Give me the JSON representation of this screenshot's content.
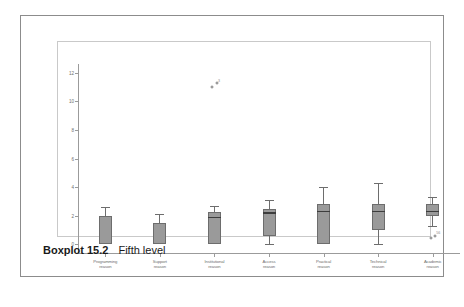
{
  "caption": {
    "title": "Boxplot 15.2",
    "text": "Fifth level"
  },
  "chart_data": {
    "type": "boxplot",
    "title": "",
    "xlabel": "",
    "ylabel": "",
    "ylim": [
      -0.6,
      12.6
    ],
    "yticks": [
      0,
      2,
      4,
      6,
      8,
      10,
      12
    ],
    "ytick_labels": [
      "0",
      "2",
      "4",
      "6",
      "8",
      "10",
      "12"
    ],
    "grid": false,
    "legend": "none",
    "categories": [
      "Programming\nreason",
      "Support\nreason",
      "Institutional\nreason",
      "Access\nreason",
      "Practical\nreason",
      "Technical\nreason",
      "Academic\nreason"
    ],
    "boxes": [
      {
        "label": "Programming reason",
        "whisker_low": 0.0,
        "q1": 0.0,
        "median": 0.0,
        "q3": 2.0,
        "whisker_high": 2.6,
        "outliers": []
      },
      {
        "label": "Support reason",
        "whisker_low": 0.0,
        "q1": 0.0,
        "median": 0.0,
        "q3": 1.5,
        "whisker_high": 2.1,
        "outliers": []
      },
      {
        "label": "Institutional reason",
        "whisker_low": 0.0,
        "q1": 0.0,
        "median": 1.9,
        "q3": 2.25,
        "whisker_high": 2.7,
        "outliers": [
          11.0,
          11.25
        ]
      },
      {
        "label": "Access reason",
        "whisker_low": 0.0,
        "q1": 0.6,
        "median": 2.2,
        "q3": 2.5,
        "whisker_high": 3.1,
        "outliers": []
      },
      {
        "label": "Practical reason",
        "whisker_low": 0.0,
        "q1": 0.0,
        "median": 2.3,
        "q3": 2.8,
        "whisker_high": 4.0,
        "outliers": []
      },
      {
        "label": "Technical reason",
        "whisker_low": 0.0,
        "q1": 1.0,
        "median": 2.3,
        "q3": 2.8,
        "whisker_high": 4.3,
        "outliers": []
      },
      {
        "label": "Academic reason",
        "whisker_low": 1.3,
        "q1": 2.0,
        "median": 2.3,
        "q3": 2.8,
        "whisker_high": 3.3,
        "outliers": [
          0.45,
          0.6
        ]
      }
    ],
    "outlier_annotations": [
      {
        "box": "Institutional reason",
        "text": "3"
      },
      {
        "box": "Academic reason",
        "text": "56"
      }
    ],
    "colors": {
      "box_fill": "#9a9a9a",
      "box_edge": "#6d6d6d",
      "median": "#3d3d3d",
      "axis": "#9b9b9b",
      "frame": "#c9c9c9",
      "figure_border": "#8c8c8c"
    }
  }
}
